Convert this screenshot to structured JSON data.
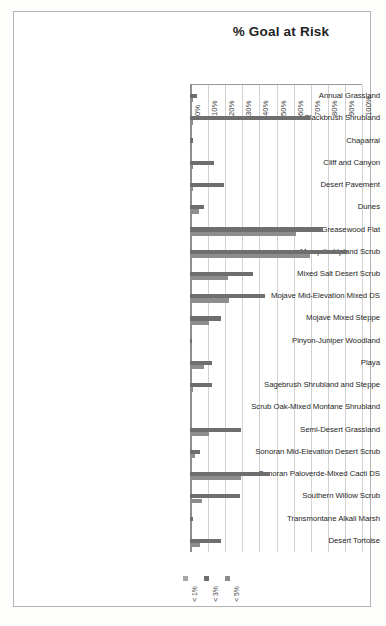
{
  "chart_data": {
    "type": "bar",
    "orientation": "horizontal",
    "title": "% Goal at Risk",
    "xlabel": "",
    "ylabel": "",
    "xlim": [
      0,
      100
    ],
    "grid": true,
    "legend_position": "bottom",
    "tick_labels": [
      "0%",
      "10%",
      "20%",
      "30%",
      "40%",
      "50%",
      "60%",
      "70%",
      "80%",
      "90%",
      "100%"
    ],
    "tick_values": [
      0,
      10,
      20,
      30,
      40,
      50,
      60,
      70,
      80,
      90,
      100
    ],
    "categories": [
      "Annual Grassland",
      "Blackbrush Shrubland",
      "Chaparral",
      "Cliff and Canyon",
      "Desert Pavement",
      "Dunes",
      "Greasewood Flat",
      "Mesquite Upland Scrub",
      "Mixed Salt Desert Scrub",
      "Mojave Mid-Elevation Mixed DS",
      "Mojave Mixed Steppe",
      "Pinyon-Juniper Woodland",
      "Playa",
      "Sagebrush Shrubland and Steppe",
      "Scrub Oak-Mixed Montane Shrubland",
      "Semi-Desert Grassland",
      "Sonoran Mid-Elevation Desert Scrub",
      "Sonoran Paloverde-Mixed Cacti DS",
      "Southern Willow Scrub",
      "Transmontane Alkali Marsh",
      "Desert Tortoise"
    ],
    "series": [
      {
        "name": "< 1%",
        "color": "#a8a8a8",
        "values": [
          0,
          0,
          0,
          0,
          0,
          0,
          0,
          0,
          0,
          0,
          0,
          0,
          0,
          0,
          0,
          0,
          0,
          0,
          0,
          0,
          0
        ]
      },
      {
        "name": "< 3%",
        "color": "#6e6e6e",
        "values": [
          4,
          70,
          2,
          14,
          20,
          8,
          78,
          92,
          37,
          44,
          18,
          1,
          13,
          13,
          0,
          30,
          6,
          47,
          29,
          2,
          18
        ]
      },
      {
        "name": "< 5%",
        "color": "#8d8d8d",
        "values": [
          1.5,
          1.5,
          0.8,
          1.5,
          2,
          5,
          62,
          70,
          22,
          23,
          11,
          0.5,
          8,
          1.5,
          0,
          11,
          3,
          30,
          7,
          1,
          6
        ]
      }
    ],
    "legend": [
      {
        "label": "< 1%",
        "color": "#a8a8a8"
      },
      {
        "label": "< 3%",
        "color": "#6e6e6e"
      },
      {
        "label": "< 5%",
        "color": "#8d8d8d"
      }
    ]
  }
}
